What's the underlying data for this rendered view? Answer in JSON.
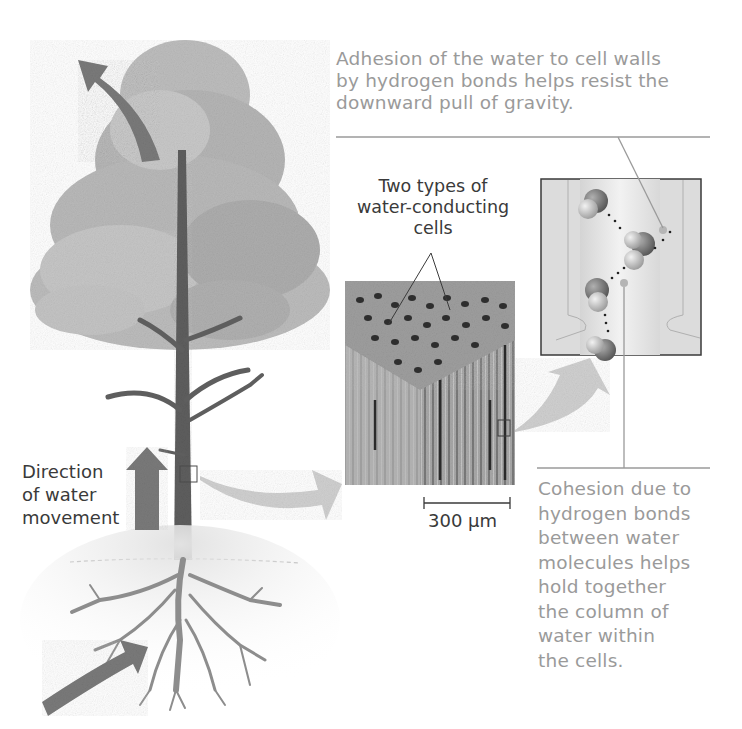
{
  "figure": {
    "adhesion_caption": {
      "lines": [
        "Adhesion of the water to cell walls",
        "by hydrogen bonds helps resist the",
        "downward pull of gravity."
      ]
    },
    "cells_label": {
      "lines": [
        "Two types of",
        "water-conducting",
        "cells"
      ]
    },
    "scale_bar": {
      "label": "300 µm"
    },
    "direction_label": {
      "lines": [
        "Direction",
        "of water",
        "movement"
      ]
    },
    "cohesion_caption": {
      "lines": [
        "Cohesion due to",
        "hydrogen bonds",
        "between water",
        "molecules helps",
        "hold together",
        "the column of",
        "water within",
        "the cells."
      ]
    },
    "colors": {
      "caption_gray": "#9a9a9a",
      "label_dark": "#3a3a3a",
      "arrow_dark": "#7a7a7a",
      "arrow_light": "#cfcfcf",
      "foliage": "#b8b8b8",
      "trunk": "#5a5a5a"
    },
    "panels": [
      {
        "name": "tree-illustration"
      },
      {
        "name": "xylem-micrograph"
      },
      {
        "name": "water-molecule-closeup"
      }
    ]
  }
}
